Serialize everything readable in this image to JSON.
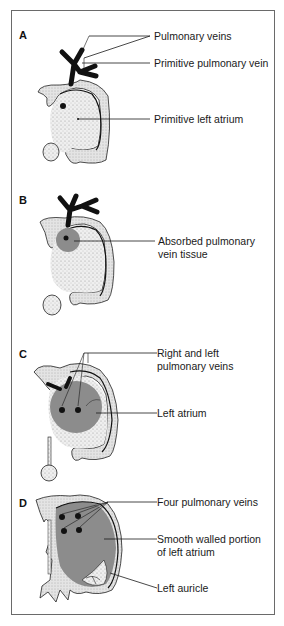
{
  "figure": {
    "panels": [
      {
        "letter": "A",
        "labels": [
          {
            "text": "Pulmonary veins"
          },
          {
            "text": "Primitive pulmonary vein"
          },
          {
            "text": "Primitive left atrium"
          }
        ]
      },
      {
        "letter": "B",
        "labels": [
          {
            "line1": "Absorbed pulmonary",
            "line2": "vein tissue"
          }
        ]
      },
      {
        "letter": "C",
        "labels": [
          {
            "line1": "Right and left",
            "line2": "pulmonary veins"
          },
          {
            "text": "Left atrium"
          }
        ]
      },
      {
        "letter": "D",
        "labels": [
          {
            "text": "Four pulmonary veins"
          },
          {
            "line1": "Smooth walled portion",
            "line2": "of left atrium"
          },
          {
            "text": "Left auricle"
          }
        ]
      }
    ]
  },
  "colors": {
    "border": "#6a6a6a",
    "vein_black": "#111111",
    "absorbed_tissue": "#8c8c8c",
    "stipple": "#d9d9d9",
    "leader_line": "#1a1a1a"
  }
}
